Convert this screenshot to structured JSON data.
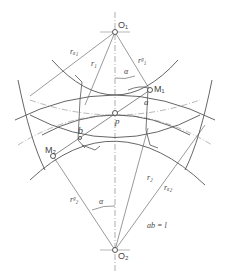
{
  "diagram": {
    "type": "gear meshing geometry",
    "colors": {
      "line": "#555555",
      "thin": "#888888",
      "background": "#ffffff"
    },
    "points": {
      "O1": {
        "label": "O₁",
        "x": 115,
        "y": 32
      },
      "O2": {
        "label": "O₂",
        "x": 115,
        "y": 250
      },
      "M1": {
        "label": "M₁",
        "x": 150,
        "y": 90
      },
      "M2": {
        "label": "M₂",
        "x": 53,
        "y": 156
      },
      "P": {
        "label": "p",
        "x": 115,
        "y": 113
      },
      "a": {
        "label": "a",
        "x": 146,
        "y": 100
      },
      "b": {
        "label": "b",
        "x": 80,
        "y": 138
      }
    },
    "labels": {
      "ra1": "rₐ₁",
      "r1": "r₁",
      "rg1": "rᵍ₁",
      "alpha_top": "α",
      "alpha_bottom": "α",
      "r2": "r₂",
      "ra2": "rₐ₂",
      "rg2": "rᵍ₂"
    },
    "equation": "ab = l"
  }
}
